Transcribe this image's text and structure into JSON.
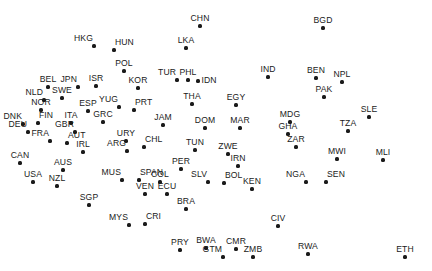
{
  "figure": {
    "type": "scatter-labeled",
    "width": 432,
    "height": 271,
    "background": "#ffffff",
    "point_color": "#1a1a1a",
    "label_color": "#1a1a1a",
    "axes_visible": false,
    "gridlines": false,
    "title": "",
    "xlabel": "",
    "ylabel": "",
    "legend": "none"
  },
  "chart_data": {
    "type": "scatter",
    "title": "",
    "xlabel": "",
    "ylabel": "",
    "xlim": [
      0,
      432
    ],
    "ylim": [
      271,
      0
    ],
    "grid": false,
    "legend": "none",
    "point_label_field": "label",
    "note": "Unlabeled axes; coordinates are pixel positions of each country marker in the 432x271 figure.",
    "points": [
      {
        "label": "CHN",
        "x": 200,
        "y": 26,
        "pos": "above"
      },
      {
        "label": "BGD",
        "x": 323,
        "y": 28,
        "pos": "above"
      },
      {
        "label": "HKG",
        "x": 94,
        "y": 46,
        "pos": "above-left"
      },
      {
        "label": "HUN",
        "x": 114,
        "y": 50,
        "pos": "above-right"
      },
      {
        "label": "LKA",
        "x": 186,
        "y": 48,
        "pos": "above"
      },
      {
        "label": "POL",
        "x": 124,
        "y": 71,
        "pos": "above"
      },
      {
        "label": "BEL",
        "x": 48,
        "y": 87,
        "pos": "above"
      },
      {
        "label": "JPN",
        "x": 78,
        "y": 87,
        "pos": "above-left"
      },
      {
        "label": "ISR",
        "x": 96,
        "y": 86,
        "pos": "above"
      },
      {
        "label": "KOR",
        "x": 138,
        "y": 88,
        "pos": "above"
      },
      {
        "label": "TUR",
        "x": 177,
        "y": 80,
        "pos": "above-left"
      },
      {
        "label": "PHL",
        "x": 188,
        "y": 80,
        "pos": "above"
      },
      {
        "label": "IDN",
        "x": 198,
        "y": 81,
        "pos": "right"
      },
      {
        "label": "IND",
        "x": 268,
        "y": 77,
        "pos": "above"
      },
      {
        "label": "BEN",
        "x": 316,
        "y": 78,
        "pos": "above"
      },
      {
        "label": "NPL",
        "x": 342,
        "y": 82,
        "pos": "above"
      },
      {
        "label": "NLD",
        "x": 44,
        "y": 100,
        "pos": "above-left"
      },
      {
        "label": "SWE",
        "x": 62,
        "y": 98,
        "pos": "above"
      },
      {
        "label": "ESP",
        "x": 88,
        "y": 111,
        "pos": "above"
      },
      {
        "label": "YUG",
        "x": 119,
        "y": 107,
        "pos": "above-left"
      },
      {
        "label": "PRT",
        "x": 134,
        "y": 110,
        "pos": "above-right"
      },
      {
        "label": "THA",
        "x": 192,
        "y": 104,
        "pos": "above"
      },
      {
        "label": "EGY",
        "x": 236,
        "y": 105,
        "pos": "above"
      },
      {
        "label": "PAK",
        "x": 324,
        "y": 97,
        "pos": "above"
      },
      {
        "label": "NOR",
        "x": 41,
        "y": 110,
        "pos": "above"
      },
      {
        "label": "MDG",
        "x": 290,
        "y": 122,
        "pos": "above"
      },
      {
        "label": "SLE",
        "x": 369,
        "y": 117,
        "pos": "above"
      },
      {
        "label": "DNK",
        "x": 23,
        "y": 124,
        "pos": "above-left"
      },
      {
        "label": "FIN",
        "x": 38,
        "y": 123,
        "pos": "above-right"
      },
      {
        "label": "ITA",
        "x": 71,
        "y": 123,
        "pos": "above"
      },
      {
        "label": "GRC",
        "x": 103,
        "y": 122,
        "pos": "above"
      },
      {
        "label": "JAM",
        "x": 163,
        "y": 125,
        "pos": "above"
      },
      {
        "label": "MAR",
        "x": 240,
        "y": 128,
        "pos": "above"
      },
      {
        "label": "DOM",
        "x": 205,
        "y": 128,
        "pos": "above"
      },
      {
        "label": "GHA",
        "x": 288,
        "y": 134,
        "pos": "above"
      },
      {
        "label": "TZA",
        "x": 348,
        "y": 131,
        "pos": "above"
      },
      {
        "label": "DEU",
        "x": 28,
        "y": 132,
        "pos": "above-left"
      },
      {
        "label": "GBR",
        "x": 75,
        "y": 132,
        "pos": "above-left"
      },
      {
        "label": "FRA",
        "x": 50,
        "y": 141,
        "pos": "above-left"
      },
      {
        "label": "AUT",
        "x": 67,
        "y": 143,
        "pos": "above-right"
      },
      {
        "label": "URY",
        "x": 126,
        "y": 141,
        "pos": "above"
      },
      {
        "label": "CHL",
        "x": 144,
        "y": 147,
        "pos": "above-right"
      },
      {
        "label": "ARG",
        "x": 127,
        "y": 151,
        "pos": "above-left"
      },
      {
        "label": "ZAR",
        "x": 296,
        "y": 147,
        "pos": "above"
      },
      {
        "label": "IRL",
        "x": 83,
        "y": 152,
        "pos": "above"
      },
      {
        "label": "TUN",
        "x": 195,
        "y": 150,
        "pos": "above"
      },
      {
        "label": "ZWE",
        "x": 228,
        "y": 154,
        "pos": "above"
      },
      {
        "label": "MWI",
        "x": 337,
        "y": 159,
        "pos": "above"
      },
      {
        "label": "MLI",
        "x": 383,
        "y": 160,
        "pos": "above"
      },
      {
        "label": "CAN",
        "x": 20,
        "y": 163,
        "pos": "above"
      },
      {
        "label": "AUS",
        "x": 63,
        "y": 170,
        "pos": "above"
      },
      {
        "label": "IRN",
        "x": 238,
        "y": 166,
        "pos": "above"
      },
      {
        "label": "PER",
        "x": 181,
        "y": 169,
        "pos": "above"
      },
      {
        "label": "USA",
        "x": 33,
        "y": 182,
        "pos": "above"
      },
      {
        "label": "NZL",
        "x": 57,
        "y": 186,
        "pos": "above"
      },
      {
        "label": "MUS",
        "x": 122,
        "y": 180,
        "pos": "above-left"
      },
      {
        "label": "SPAN",
        "x": 139,
        "y": 180,
        "pos": "above-right"
      },
      {
        "label": "COL",
        "x": 160,
        "y": 182,
        "pos": "above"
      },
      {
        "label": "SLV",
        "x": 208,
        "y": 182,
        "pos": "above-left"
      },
      {
        "label": "BOL",
        "x": 224,
        "y": 183,
        "pos": "above-right"
      },
      {
        "label": "KEN",
        "x": 252,
        "y": 189,
        "pos": "above"
      },
      {
        "label": "NGA",
        "x": 306,
        "y": 182,
        "pos": "above-left"
      },
      {
        "label": "SEN",
        "x": 326,
        "y": 182,
        "pos": "above-right"
      },
      {
        "label": "SGP",
        "x": 89,
        "y": 205,
        "pos": "above"
      },
      {
        "label": "VEN",
        "x": 145,
        "y": 194,
        "pos": "above"
      },
      {
        "label": "ECU",
        "x": 167,
        "y": 194,
        "pos": "above"
      },
      {
        "label": "BRA",
        "x": 186,
        "y": 209,
        "pos": "above"
      },
      {
        "label": "CIV",
        "x": 278,
        "y": 226,
        "pos": "above"
      },
      {
        "label": "MYS",
        "x": 129,
        "y": 225,
        "pos": "above-left"
      },
      {
        "label": "CRI",
        "x": 145,
        "y": 224,
        "pos": "above-right"
      },
      {
        "label": "PRY",
        "x": 180,
        "y": 250,
        "pos": "above"
      },
      {
        "label": "BWA",
        "x": 206,
        "y": 248,
        "pos": "above"
      },
      {
        "label": "CMR",
        "x": 236,
        "y": 249,
        "pos": "above"
      },
      {
        "label": "GTM",
        "x": 223,
        "y": 257,
        "pos": "above-left"
      },
      {
        "label": "ZMB",
        "x": 253,
        "y": 257,
        "pos": "above"
      },
      {
        "label": "RWA",
        "x": 308,
        "y": 254,
        "pos": "above"
      },
      {
        "label": "ETH",
        "x": 405,
        "y": 257,
        "pos": "above"
      }
    ]
  }
}
